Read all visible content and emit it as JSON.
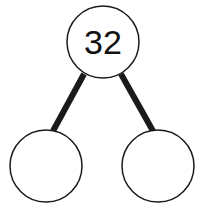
{
  "diagram": {
    "type": "number-bond",
    "whole": "32",
    "parts": [
      "",
      ""
    ],
    "colors": {
      "stroke": "#1a1a1a",
      "fill": "#ffffff",
      "text": "#111111"
    }
  }
}
